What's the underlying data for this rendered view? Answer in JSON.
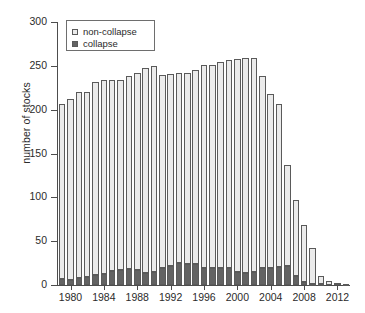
{
  "chart_data": {
    "type": "bar",
    "subtype": "stacked-bar",
    "title": "",
    "xlabel": "",
    "ylabel": "number of stocks",
    "ylim": [
      0,
      300
    ],
    "yticks": [
      0,
      50,
      100,
      150,
      200,
      250,
      300
    ],
    "xlim": [
      1979,
      2013
    ],
    "xticks": [
      1980,
      1984,
      1988,
      1992,
      1996,
      2000,
      2004,
      2008,
      2012
    ],
    "grid": false,
    "legend": {
      "position": "top-left",
      "entries": [
        {
          "label": "non-collapse",
          "color": "#ebebeb",
          "marker": "square"
        },
        {
          "label": "collapse",
          "color": "#636363",
          "marker": "square"
        }
      ]
    },
    "categories": [
      1979,
      1980,
      1981,
      1982,
      1983,
      1984,
      1985,
      1986,
      1987,
      1988,
      1989,
      1990,
      1991,
      1992,
      1993,
      1994,
      1995,
      1996,
      1997,
      1998,
      1999,
      2000,
      2001,
      2002,
      2003,
      2004,
      2005,
      2006,
      2007,
      2008,
      2009,
      2010,
      2011,
      2012,
      2013
    ],
    "series": [
      {
        "name": "collapse",
        "color": "#636363",
        "values": [
          7,
          6,
          8,
          9,
          11,
          13,
          16,
          17,
          18,
          17,
          14,
          15,
          19,
          22,
          25,
          24,
          24,
          19,
          19,
          19,
          19,
          15,
          14,
          15,
          19,
          19,
          21,
          22,
          10,
          3,
          1,
          1,
          0,
          0,
          0
        ]
      },
      {
        "name": "non-collapse",
        "color": "#ebebeb",
        "values": [
          199,
          206,
          212,
          211,
          220,
          221,
          218,
          217,
          220,
          225,
          234,
          235,
          221,
          219,
          217,
          218,
          221,
          232,
          232,
          235,
          238,
          243,
          245,
          244,
          219,
          199,
          185,
          115,
          87,
          65,
          41,
          9,
          4,
          2,
          1
        ]
      }
    ],
    "totals": [
      206,
      212,
      220,
      220,
      231,
      234,
      234,
      234,
      238,
      242,
      248,
      250,
      240,
      241,
      242,
      242,
      245,
      251,
      251,
      254,
      257,
      258,
      259,
      259,
      238,
      218,
      206,
      137,
      97,
      68,
      42,
      10,
      4,
      2,
      1
    ]
  },
  "axis": {
    "ylabel": "number of stocks",
    "ytick_labels": [
      "0",
      "50",
      "100",
      "150",
      "200",
      "250",
      "300"
    ],
    "xtick_labels": [
      "1980",
      "1984",
      "1988",
      "1992",
      "1996",
      "2000",
      "2004",
      "2008",
      "2012"
    ]
  },
  "legend": {
    "items": [
      {
        "label": "non-collapse"
      },
      {
        "label": "collapse"
      }
    ]
  }
}
